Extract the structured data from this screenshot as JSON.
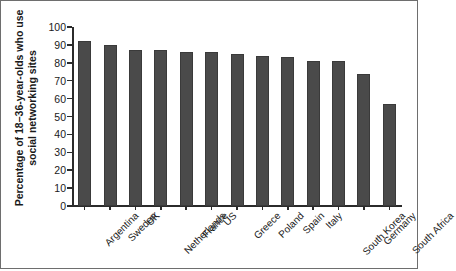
{
  "chart_data": {
    "type": "bar",
    "title": "",
    "xlabel": "",
    "ylabel": "Percentage of 18–36-year-olds who use social networking sites",
    "ylabel_lines": [
      "Percentage of 18–36-year-olds who use",
      "social networking sites"
    ],
    "categories": [
      "Argentina",
      "Sweden",
      "UK",
      "Netherlands",
      "France",
      "US",
      "Greece",
      "Poland",
      "Spain",
      "Italy",
      "South Korea",
      "Germany",
      "South Africa"
    ],
    "values": [
      92,
      90,
      87,
      87,
      86,
      86,
      85,
      84,
      83,
      81,
      81,
      74,
      57
    ],
    "ylim": [
      0,
      100
    ],
    "yticks": [
      0,
      10,
      20,
      30,
      40,
      50,
      60,
      70,
      80,
      90,
      100
    ],
    "ytick_labels": [
      "0",
      "10",
      "20",
      "30",
      "40",
      "50",
      "60",
      "70",
      "80",
      "90",
      "100"
    ],
    "grid": false,
    "legend": null,
    "bar_color": "#4a4a4a",
    "axis_color": "#2b2b2b",
    "text_color": "#1a1a1a",
    "background_color": "#ffffff",
    "frame_border_color": "#6e6e6e"
  }
}
